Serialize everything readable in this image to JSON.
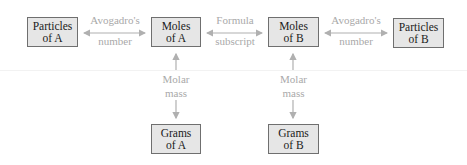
{
  "diagram": {
    "nodes": {
      "particles_a": {
        "line1": "Particles",
        "line2": "of A"
      },
      "moles_a": {
        "line1": "Moles",
        "line2": "of A"
      },
      "moles_b": {
        "line1": "Moles",
        "line2": "of B"
      },
      "particles_b": {
        "line1": "Particles",
        "line2": "of B"
      },
      "grams_a": {
        "line1": "Grams",
        "line2": "of A"
      },
      "grams_b": {
        "line1": "Grams",
        "line2": "of B"
      }
    },
    "edges": {
      "avogadro_a": {
        "line1": "Avogadro's",
        "line2": "number",
        "from": "Particles of A",
        "to": "Moles of A",
        "direction": "both"
      },
      "formula": {
        "line1": "Formula",
        "line2": "subscript",
        "from": "Moles of A",
        "to": "Moles of B",
        "direction": "both"
      },
      "avogadro_b": {
        "line1": "Avogadro's",
        "line2": "number",
        "from": "Moles of B",
        "to": "Particles of B",
        "direction": "both"
      },
      "molar_a": {
        "line1": "Molar",
        "line2": "mass",
        "from": "Moles of A",
        "to": "Grams of A",
        "direction": "both"
      },
      "molar_b": {
        "line1": "Molar",
        "line2": "mass",
        "from": "Moles of B",
        "to": "Grams of B",
        "direction": "both"
      }
    },
    "colors": {
      "box_fill": "#e6e6e6",
      "box_border": "#6f6f6f",
      "arrow": "#b0b0b0",
      "label_text": "#a9a9a9",
      "box_text": "#1a1a1a"
    }
  }
}
